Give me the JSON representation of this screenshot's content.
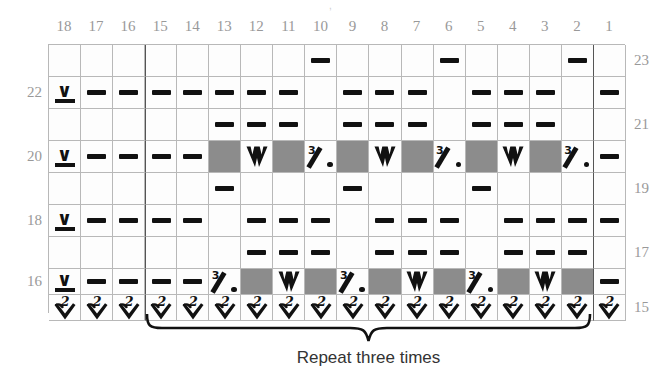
{
  "chart_data": {
    "type": "table",
    "title": "",
    "n_cols": 18,
    "n_rows": 9,
    "column_headers": [
      "18",
      "17",
      "16",
      "15",
      "14",
      "13",
      "12",
      "11",
      "10",
      "9",
      "8",
      "7",
      "6",
      "5",
      "4",
      "3",
      "2",
      "1"
    ],
    "row_labels_left": [
      "",
      "22",
      "",
      "20",
      "",
      "18",
      "",
      "16",
      ""
    ],
    "row_labels_right": [
      "23",
      "",
      "21",
      "",
      "19",
      "",
      "17",
      "",
      "15"
    ],
    "row_heights": [
      "tall",
      "tall",
      "tall",
      "tall",
      "tall",
      "tall",
      "tall",
      "short",
      "short"
    ],
    "legend_symbols": {
      "dash": "purl-dash",
      "vbar": "slip-stitch-v-underline",
      "w": "central-double-decrease",
      "pct": "3-wrap-slash-dot",
      "two_down": "two-stitches-down-arrow"
    },
    "colors": {
      "grid_line": "#b8b8b8",
      "heavy_line": "#555555",
      "shaded_cell": "#8c8c8c",
      "cell_bg": "#fdfdfd",
      "symbol": "#111111",
      "label_text": "#999999",
      "caption_text": "#333333"
    },
    "repeat": {
      "label": "Repeat three times",
      "start_col": "15",
      "end_col": "2"
    },
    "rows": [
      {
        "label_right": "23",
        "label_left": "",
        "h": "tall",
        "cells": [
          "",
          "",
          "",
          "",
          "",
          "",
          "",
          "",
          "dash",
          "",
          "",
          "",
          "dash",
          "",
          "",
          "",
          "dash",
          ""
        ]
      },
      {
        "label_right": "",
        "label_left": "22",
        "h": "tall",
        "cells": [
          "vbar",
          "dash",
          "dash",
          "dash",
          "dash",
          "dash",
          "dash",
          "dash",
          "",
          "dash",
          "dash",
          "dash",
          "",
          "dash",
          "dash",
          "dash",
          "",
          "dash"
        ]
      },
      {
        "label_right": "21",
        "label_left": "",
        "h": "tall",
        "cells": [
          "",
          "",
          "",
          "",
          "",
          "dash",
          "dash",
          "dash",
          "",
          "dash",
          "dash",
          "dash",
          "",
          "dash",
          "dash",
          "dash",
          "",
          ""
        ]
      },
      {
        "label_right": "",
        "label_left": "20",
        "h": "tall",
        "cells": [
          "vbar",
          "dash",
          "dash",
          "dash",
          "dash",
          "gray",
          "w",
          "gray",
          "pct",
          "gray",
          "w",
          "gray",
          "pct",
          "gray",
          "w",
          "gray",
          "pct",
          "dash"
        ]
      },
      {
        "label_right": "19",
        "label_left": "",
        "h": "tall",
        "cells": [
          "",
          "",
          "",
          "",
          "",
          "dash",
          "",
          "",
          "",
          "dash",
          "",
          "",
          "",
          "dash",
          "",
          "",
          "",
          ""
        ]
      },
      {
        "label_right": "",
        "label_left": "18",
        "h": "tall",
        "cells": [
          "vbar",
          "dash",
          "dash",
          "dash",
          "dash",
          "",
          "dash",
          "dash",
          "dash",
          "",
          "dash",
          "dash",
          "dash",
          "",
          "dash",
          "dash",
          "dash",
          "dash"
        ]
      },
      {
        "label_right": "17",
        "label_left": "",
        "h": "tall",
        "cells": [
          "",
          "",
          "",
          "",
          "",
          "",
          "dash",
          "dash",
          "dash",
          "",
          "dash",
          "dash",
          "dash",
          "",
          "dash",
          "dash",
          "dash",
          ""
        ]
      },
      {
        "label_right": "",
        "label_left": "16",
        "h": "short",
        "cells": [
          "vbar",
          "dash",
          "dash",
          "dash",
          "dash",
          "pct",
          "gray",
          "w",
          "gray",
          "pct",
          "gray",
          "w",
          "gray",
          "pct",
          "gray",
          "w",
          "gray",
          "dash"
        ]
      },
      {
        "label_right": "15",
        "label_left": "",
        "h": "short",
        "cells": [
          "two_down",
          "two_down",
          "two_down",
          "two_down",
          "two_down",
          "two_down",
          "two_down",
          "two_down",
          "two_down",
          "two_down",
          "two_down",
          "two_down",
          "two_down",
          "two_down",
          "two_down",
          "two_down",
          "two_down",
          "two_down"
        ]
      }
    ]
  }
}
